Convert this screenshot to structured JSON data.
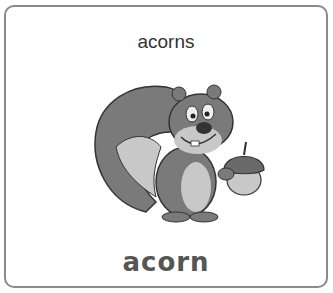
{
  "card": {
    "caption": "acorns",
    "image": {
      "subject": "squirrel-holding-acorn",
      "style": "grayscale cartoon"
    },
    "word": "acorn",
    "colors": {
      "border": "#8a8a8a",
      "caption": "#333333",
      "word": "#555555"
    }
  }
}
